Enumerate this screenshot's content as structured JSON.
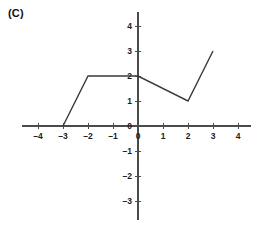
{
  "figure": {
    "panel_label": "(C)",
    "background_color": "#ffffff",
    "axis_color": "#4a4a4a",
    "line_color": "#3a3a3a"
  },
  "chart_data": {
    "type": "line",
    "title": "(C)",
    "xlabel": "",
    "ylabel": "",
    "xlim": [
      -4.6,
      4.6
    ],
    "ylim": [
      -3.6,
      4.6
    ],
    "grid": false,
    "legend": null,
    "x_ticks": [
      -4,
      -3,
      -2,
      -1,
      0,
      1,
      2,
      3,
      4
    ],
    "x_tick_labels": [
      "–4",
      "–3",
      "–2",
      "–1",
      "0",
      "1",
      "2",
      "3",
      "4"
    ],
    "y_ticks": [
      -3,
      -2,
      -1,
      0,
      1,
      2,
      3,
      4
    ],
    "y_tick_labels": [
      "–3",
      "–2",
      "–1",
      "0",
      "1",
      "2",
      "3",
      "4"
    ],
    "series": [
      {
        "name": "piecewise-function",
        "x": [
          -3,
          -2,
          0,
          2,
          3
        ],
        "y": [
          0,
          2,
          2,
          1,
          3
        ]
      }
    ]
  },
  "geometry": {
    "origin_px": {
      "x": 138,
      "y": 126
    },
    "unit_px": 25,
    "x_axis_extent_px": {
      "start": 22,
      "end": 251
    },
    "y_axis_extent_px": {
      "start": 12,
      "end": 220
    },
    "tick_len_px": 3
  }
}
